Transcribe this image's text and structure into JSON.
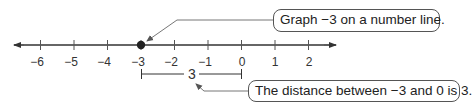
{
  "number_line": {
    "min_label": -6,
    "max_label": 2,
    "ticks": [
      {
        "value": -6,
        "label": "−6"
      },
      {
        "value": -5,
        "label": "−5"
      },
      {
        "value": -4,
        "label": "−4"
      },
      {
        "value": -3,
        "label": "−3"
      },
      {
        "value": -2,
        "label": "−2"
      },
      {
        "value": -1,
        "label": "−1"
      },
      {
        "value": 0,
        "label": "0"
      },
      {
        "value": 1,
        "label": "1"
      },
      {
        "value": 2,
        "label": "2"
      }
    ],
    "graphed_point": -3,
    "point_color": "#222222",
    "line_color": "#333333"
  },
  "distance_bracket": {
    "from": -3,
    "to": 0,
    "label": "3"
  },
  "callouts": {
    "graph_note": "Graph −3 on a number line.",
    "distance_note": "The distance between −3 and 0 is 3."
  }
}
